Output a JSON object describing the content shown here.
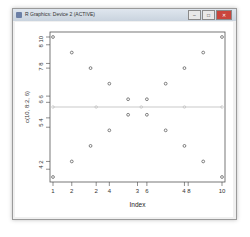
{
  "window": {
    "title": "R Graphics: Device 2 (ACTIVE)",
    "buttons": {
      "minimize": "–",
      "maximize": "□",
      "close": "✕"
    }
  },
  "chart_data": {
    "type": "scatter",
    "title": "",
    "xlabel": "Index",
    "ylabel": "c(10, 8:2, 6)",
    "x_tick_labels": [
      "1",
      "2",
      "2",
      "4",
      "3",
      "6",
      "4",
      "8",
      "10"
    ],
    "y_tick_labels": [
      "2",
      "4",
      "4",
      "5",
      "6",
      "6",
      "8",
      "7",
      "8",
      "10"
    ],
    "x": [
      1,
      2,
      3,
      4,
      5,
      6,
      7,
      8,
      9,
      10
    ],
    "series": [
      {
        "name": "upper",
        "values": [
          10,
          9,
          8,
          7,
          6,
          6,
          7,
          8,
          9,
          10
        ]
      },
      {
        "name": "lower",
        "values": [
          1,
          2,
          3,
          4,
          5,
          5,
          4,
          3,
          2,
          1
        ]
      },
      {
        "name": "mean-line",
        "values": [
          5.5,
          5.5,
          5.5,
          5.5,
          5.5,
          5.5,
          5.5,
          5.5,
          5.5,
          5.5
        ]
      }
    ],
    "ylim": [
      1,
      10
    ],
    "xlim": [
      1,
      10
    ],
    "grid": false,
    "legend": "none"
  }
}
